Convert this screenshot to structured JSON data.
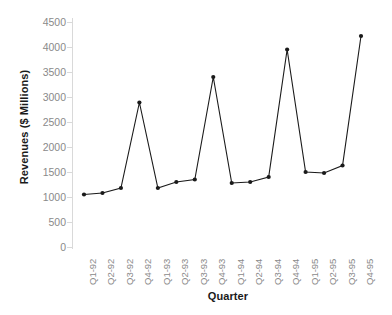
{
  "chart_data": {
    "type": "line",
    "title": "",
    "xlabel": "Quarter",
    "ylabel": "Revenues ($ Millions)",
    "categories": [
      "Q1-92",
      "Q2-92",
      "Q3-92",
      "Q4-92",
      "Q1-93",
      "Q2-93",
      "Q3-93",
      "Q4-93",
      "Q1-94",
      "Q2-94",
      "Q3-94",
      "Q4-94",
      "Q1-95",
      "Q2-95",
      "Q3-95",
      "Q4-95"
    ],
    "values": [
      1050,
      1080,
      1180,
      2890,
      1180,
      1300,
      1350,
      3400,
      1280,
      1300,
      1400,
      3950,
      1500,
      1480,
      1630,
      4220
    ],
    "ylim": [
      0,
      4500
    ],
    "yticks": [
      0,
      500,
      1000,
      1500,
      2000,
      2500,
      3000,
      3500,
      4000,
      4500
    ],
    "ytick_labels": [
      "0",
      "500",
      "1000",
      "1500",
      "2000",
      "2500",
      "3000",
      "3500",
      "4000",
      "4500"
    ],
    "grid": false,
    "legend": null,
    "marker": "circle",
    "line_color": "#1a1a1a",
    "marker_color": "#1a1a1a",
    "axis_color": "#d9d9d9",
    "tick_label_color": "#8a8a8a",
    "axis_title_color": "#1a1a1a"
  }
}
